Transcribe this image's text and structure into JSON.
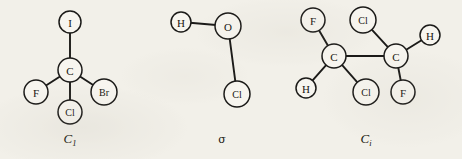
{
  "figure": {
    "background_color": "#f2f0e9",
    "ink_color": "#1b1a18",
    "molecules": [
      {
        "id": "molecule-1",
        "caption": "C",
        "caption_subscript": "1",
        "caption_x": 70,
        "caption_y": 143,
        "atoms": [
          {
            "id": "atom-i",
            "label": "I",
            "x": 70,
            "y": 22,
            "r": 11
          },
          {
            "id": "atom-c",
            "label": "C",
            "x": 70,
            "y": 70,
            "r": 12
          },
          {
            "id": "atom-f",
            "label": "F",
            "x": 36,
            "y": 92,
            "r": 12
          },
          {
            "id": "atom-br",
            "label": "Br",
            "x": 104,
            "y": 92,
            "r": 13
          },
          {
            "id": "atom-cl",
            "label": "Cl",
            "x": 70,
            "y": 112,
            "r": 12
          }
        ],
        "bonds": [
          {
            "from": "atom-c",
            "to": "atom-i"
          },
          {
            "from": "atom-c",
            "to": "atom-f"
          },
          {
            "from": "atom-c",
            "to": "atom-br"
          },
          {
            "from": "atom-c",
            "to": "atom-cl"
          }
        ]
      },
      {
        "id": "molecule-2",
        "caption": "σ",
        "caption_subscript": "",
        "caption_x": 222,
        "caption_y": 143,
        "atoms": [
          {
            "id": "atom-h",
            "label": "H",
            "x": 181,
            "y": 22,
            "r": 10
          },
          {
            "id": "atom-o",
            "label": "O",
            "x": 228,
            "y": 26,
            "r": 13
          },
          {
            "id": "atom-cl",
            "label": "Cl",
            "x": 237,
            "y": 94,
            "r": 13
          }
        ],
        "bonds": [
          {
            "from": "atom-h",
            "to": "atom-o"
          },
          {
            "from": "atom-o",
            "to": "atom-cl"
          }
        ]
      },
      {
        "id": "molecule-3",
        "caption": "C",
        "caption_subscript": "i",
        "caption_x": 366,
        "caption_y": 143,
        "atoms": [
          {
            "id": "atom-f1",
            "label": "F",
            "x": 313,
            "y": 20,
            "r": 12
          },
          {
            "id": "atom-cl1",
            "label": "Cl",
            "x": 363,
            "y": 20,
            "r": 13
          },
          {
            "id": "atom-h2",
            "label": "H",
            "x": 430,
            "y": 35,
            "r": 10
          },
          {
            "id": "atom-c1",
            "label": "C",
            "x": 334,
            "y": 56,
            "r": 12
          },
          {
            "id": "atom-c2",
            "label": "C",
            "x": 396,
            "y": 56,
            "r": 12
          },
          {
            "id": "atom-h1",
            "label": "H",
            "x": 306,
            "y": 88,
            "r": 10
          },
          {
            "id": "atom-cl2",
            "label": "Cl",
            "x": 366,
            "y": 92,
            "r": 13
          },
          {
            "id": "atom-f2",
            "label": "F",
            "x": 403,
            "y": 92,
            "r": 12
          }
        ],
        "bonds": [
          {
            "from": "atom-c1",
            "to": "atom-f1"
          },
          {
            "from": "atom-c1",
            "to": "atom-h1"
          },
          {
            "from": "atom-c1",
            "to": "atom-cl2"
          },
          {
            "from": "atom-c1",
            "to": "atom-c2"
          },
          {
            "from": "atom-c2",
            "to": "atom-cl1"
          },
          {
            "from": "atom-c2",
            "to": "atom-h2"
          },
          {
            "from": "atom-c2",
            "to": "atom-f2"
          }
        ]
      }
    ]
  }
}
